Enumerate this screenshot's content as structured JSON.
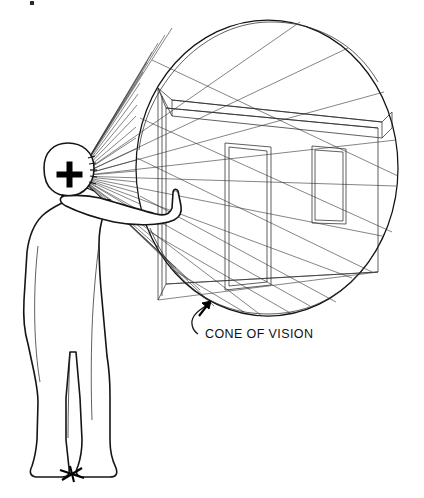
{
  "figure": {
    "style": "hand-drawn technical illustration, black ink line art on white",
    "background_color": "#ffffff",
    "ink_color": "#1a1a1a",
    "annotations": [
      {
        "id": "cone-of-vision-label",
        "text": "CONE OF VISION",
        "x": 205,
        "y": 334,
        "leader": "curved leader line rising to an arrowhead touching the lower-left arc of the vision circle"
      }
    ],
    "elements": {
      "observer": {
        "name": "standing human figure in side profile, facing right",
        "station_point_marker": "+",
        "station_point_x": 68,
        "station_point_y": 176,
        "foot_marker": "bold cross mark on the ground between the feet",
        "foot_marker_x": 72,
        "foot_marker_y": 474,
        "arm": "right arm extended forward with index finger pointing up"
      },
      "vision_circle": {
        "name": "cone of vision circle (picture-plane boundary)",
        "center_x": 268,
        "center_y": 168,
        "radius_x": 132,
        "radius_y": 148
      },
      "sight_rays": {
        "name": "converging visual rays from the eye to the picture plane",
        "origin_x": 78,
        "origin_y": 176,
        "count": 30
      },
      "interior": {
        "name": "one-point perspective room interior seen inside the circle",
        "parts": [
          "left near wall edge",
          "ceiling soffit / beam spanning left to right",
          "back wall plane",
          "door opening",
          "window opening",
          "floor and perspective convergence lines"
        ]
      }
    }
  },
  "openings": [
    {
      "name": "door-opening",
      "x": 225,
      "y": 143,
      "width": 46,
      "height": 142
    },
    {
      "name": "window-opening",
      "x": 312,
      "y": 143,
      "width": 34,
      "height": 80
    }
  ],
  "colors": {
    "background": "#ffffff",
    "line": "#1a1a1a",
    "accent": "#000000"
  }
}
